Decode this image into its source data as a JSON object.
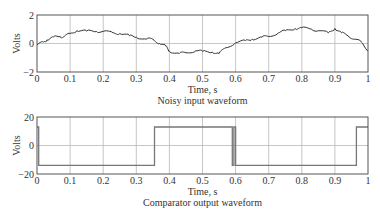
{
  "chart_data": [
    {
      "type": "line",
      "title": "Noisy input waveform",
      "xlabel": "Time, s",
      "ylabel": "Volts",
      "xlim": [
        0,
        1
      ],
      "ylim": [
        -2,
        2
      ],
      "xticks": [
        "0",
        "0.1",
        "0.2",
        "0.3",
        "0.4",
        "0.5",
        "0.6",
        "0.7",
        "0.8",
        "0.9",
        "1"
      ],
      "xtick_values": [
        0,
        0.1,
        0.2,
        0.3,
        0.4,
        0.5,
        0.6,
        0.7,
        0.8,
        0.9,
        1
      ],
      "yticks": [
        "−2",
        "0",
        "2"
      ],
      "ytick_values": [
        -2,
        0,
        2
      ],
      "grid": true,
      "series": [
        {
          "name": "Noisy input",
          "x": [
            0,
            0.02,
            0.03,
            0.05,
            0.07,
            0.08,
            0.1,
            0.12,
            0.15,
            0.18,
            0.2,
            0.23,
            0.25,
            0.28,
            0.3,
            0.33,
            0.35,
            0.37,
            0.39,
            0.4,
            0.43,
            0.45,
            0.48,
            0.5,
            0.53,
            0.55,
            0.57,
            0.6,
            0.63,
            0.65,
            0.68,
            0.7,
            0.73,
            0.75,
            0.78,
            0.8,
            0.83,
            0.85,
            0.88,
            0.9,
            0.92,
            0.94,
            0.96,
            0.98,
            1.0
          ],
          "values": [
            -0.1,
            0.1,
            0.25,
            0.45,
            0.5,
            0.45,
            0.7,
            0.9,
            0.88,
            0.85,
            0.85,
            0.75,
            0.7,
            0.55,
            0.45,
            0.3,
            0.3,
            0.0,
            -0.2,
            -0.55,
            -0.7,
            -0.65,
            -0.5,
            -0.55,
            -0.6,
            -0.7,
            -0.3,
            0.05,
            0.2,
            0.3,
            0.45,
            0.5,
            0.75,
            0.9,
            1.05,
            1.1,
            1.0,
            0.9,
            0.75,
            1.05,
            0.75,
            0.55,
            0.3,
            0.1,
            -0.5
          ]
        }
      ]
    },
    {
      "type": "line",
      "title": "Comparator output waveform",
      "xlabel": "Time, s",
      "ylabel": "Volts",
      "xlim": [
        0,
        1
      ],
      "ylim": [
        -20,
        20
      ],
      "xticks": [
        "0",
        "0.1",
        "0.2",
        "0.3",
        "0.4",
        "0.5",
        "0.6",
        "0.7",
        "0.8",
        "0.9",
        "1"
      ],
      "xtick_values": [
        0,
        0.1,
        0.2,
        0.3,
        0.4,
        0.5,
        0.6,
        0.7,
        0.8,
        0.9,
        1
      ],
      "yticks": [
        "−20",
        "0",
        "20"
      ],
      "ytick_values": [
        -20,
        0,
        20
      ],
      "grid": true,
      "series": [
        {
          "name": "Comparator output",
          "x": [
            0,
            0.005,
            0.005,
            0.355,
            0.355,
            0.59,
            0.59,
            0.595,
            0.595,
            0.6,
            0.6,
            0.605,
            0.605,
            0.965,
            0.965,
            0.97,
            0.97,
            1.0
          ],
          "values": [
            13,
            13,
            -14,
            -14,
            13,
            13,
            -14,
            -14,
            13,
            13,
            -14,
            -14,
            -14,
            -14,
            13,
            13,
            13,
            13
          ]
        }
      ]
    }
  ]
}
